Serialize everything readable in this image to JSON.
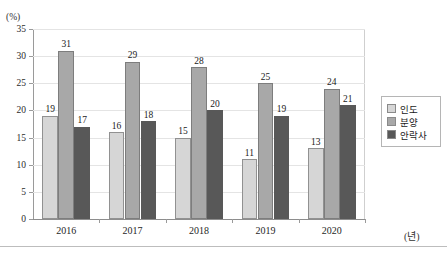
{
  "chart_data": {
    "type": "bar",
    "title": "",
    "xlabel": "(년)",
    "ylabel": "(%)",
    "ylim": [
      0,
      35
    ],
    "ytick_step": 5,
    "yticks": [
      35,
      30,
      25,
      20,
      15,
      10,
      5,
      0
    ],
    "grid": true,
    "legend_position": "right",
    "categories": [
      "2016",
      "2017",
      "2018",
      "2019",
      "2020"
    ],
    "series": [
      {
        "name": "인도",
        "color": "#d6d6d6",
        "values": [
          19,
          16,
          15,
          11,
          13
        ]
      },
      {
        "name": "분양",
        "color": "#a8a8a8",
        "values": [
          31,
          29,
          28,
          25,
          24
        ]
      },
      {
        "name": "안락사",
        "color": "#585858",
        "values": [
          17,
          18,
          20,
          19,
          21
        ]
      }
    ],
    "data_labels": true
  },
  "axis": {
    "y_unit": "(%)",
    "x_unit": "(년)"
  },
  "header": {
    "title_clipped": ""
  }
}
